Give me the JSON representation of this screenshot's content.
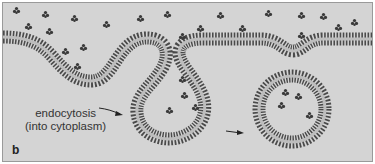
{
  "diagram": {
    "panel_label": "b",
    "caption_line1": "endocytosis",
    "caption_line2": "(into cytoplasm)",
    "colors": {
      "background": "#d4d4d4",
      "membrane_head": "#4a4a4a",
      "membrane_core": "#bdbdbd",
      "molecule": "#3a3a3a",
      "text": "#333333"
    },
    "elements": [
      {
        "name": "plasma-membrane",
        "description": "lipid bilayer with invaginations"
      },
      {
        "name": "endocytic-vesicle",
        "description": "closed circular vesicle containing molecules"
      },
      {
        "name": "extracellular-molecules",
        "description": "small star-shaped particles"
      },
      {
        "name": "arrows",
        "description": "direction of endocytosis"
      }
    ]
  }
}
